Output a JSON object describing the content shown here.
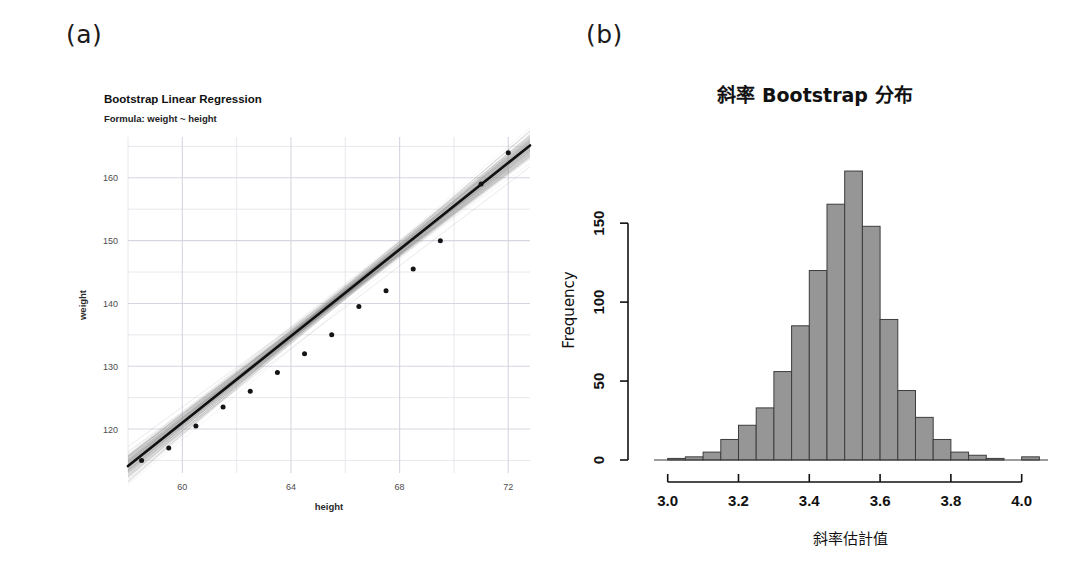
{
  "panels": {
    "a_tag": "(a)",
    "b_tag": "(b)"
  },
  "scatter": {
    "title": "Bootstrap Linear Regression",
    "subtitle": "Formula: weight ~ height",
    "xlabel": "height",
    "ylabel": "weight",
    "xticks": [
      "60",
      "64",
      "68",
      "72"
    ],
    "yticks": [
      "120",
      "130",
      "140",
      "150",
      "160"
    ]
  },
  "histogram": {
    "title": "斜率 Bootstrap 分布",
    "xlabel": "斜率估計值",
    "ylabel": "Frequency",
    "xticks": [
      "3.0",
      "3.2",
      "3.4",
      "3.6",
      "3.8",
      "4.0"
    ],
    "yticks": [
      "0",
      "50",
      "100",
      "150"
    ]
  },
  "colors": {
    "bar_fill": "#969696",
    "bar_stroke": "#3d3d3d",
    "fit_line": "#111111",
    "bootstrap_band": "#9a9a9a",
    "point": "#141414",
    "grid": "#e2e2ea",
    "axis": "#111111"
  },
  "chart_data": [
    {
      "type": "scatter",
      "title": "Bootstrap Linear Regression",
      "subtitle": "Formula: weight ~ height",
      "xlabel": "height",
      "ylabel": "weight",
      "xlim": [
        58.0,
        72.8
      ],
      "ylim": [
        113.0,
        166.5
      ],
      "xticks": [
        60,
        64,
        68,
        72
      ],
      "yticks": [
        120,
        130,
        140,
        150,
        160
      ],
      "xminor": [
        58,
        62,
        66,
        70
      ],
      "yminor": [
        115,
        125,
        135,
        145,
        155,
        165
      ],
      "grid": true,
      "legend": "none",
      "x": [
        58.5,
        59.5,
        60.5,
        61.5,
        62.5,
        63.5,
        64.5,
        65.5,
        66.5,
        67.5,
        68.5,
        69.5,
        71.0,
        72.0
      ],
      "y": [
        115.0,
        117.0,
        120.5,
        123.5,
        126.0,
        129.0,
        132.0,
        135.0,
        139.5,
        142.0,
        145.5,
        150.0,
        159.0,
        164.0
      ],
      "fit": {
        "slope": 3.45,
        "intercept": -86.0,
        "label": "weight ~ height"
      },
      "bootstrap_lines": 200,
      "annotation": "Grey band shows bootstrap resampled regression lines"
    },
    {
      "type": "bar",
      "subtype": "histogram",
      "title": "斜率 Bootstrap 分布",
      "xlabel": "斜率估計值",
      "ylabel": "Frequency",
      "xlim": [
        2.95,
        4.08
      ],
      "ylim": [
        0,
        190
      ],
      "xticks": [
        3.0,
        3.2,
        3.4,
        3.6,
        3.8,
        4.0
      ],
      "yticks": [
        0,
        50,
        100,
        150
      ],
      "grid": false,
      "bin_width": 0.05,
      "bin_starts": [
        3.0,
        3.05,
        3.1,
        3.15,
        3.2,
        3.25,
        3.3,
        3.35,
        3.4,
        3.45,
        3.5,
        3.55,
        3.6,
        3.65,
        3.7,
        3.75,
        3.8,
        3.85,
        3.9,
        3.95,
        4.0
      ],
      "categories": [
        "3.00-3.05",
        "3.05-3.10",
        "3.10-3.15",
        "3.15-3.20",
        "3.20-3.25",
        "3.25-3.30",
        "3.30-3.35",
        "3.35-3.40",
        "3.40-3.45",
        "3.45-3.50",
        "3.50-3.55",
        "3.55-3.60",
        "3.60-3.65",
        "3.65-3.70",
        "3.70-3.75",
        "3.75-3.80",
        "3.80-3.85",
        "3.85-3.90",
        "3.90-3.95",
        "3.95-4.00",
        "4.00-4.05"
      ],
      "values": [
        1,
        2,
        5,
        13,
        22,
        33,
        56,
        85,
        120,
        162,
        183,
        148,
        89,
        44,
        27,
        13,
        5,
        3,
        1,
        0,
        2
      ]
    }
  ]
}
